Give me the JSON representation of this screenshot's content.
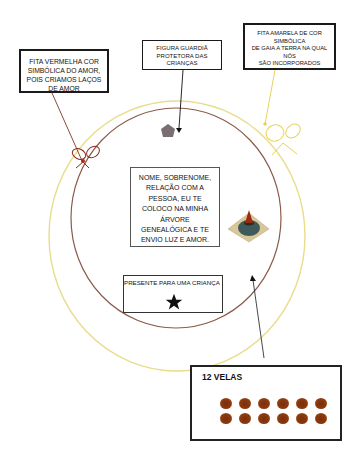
{
  "diagram": {
    "labels": {
      "red_ribbon": {
        "lines": [
          "FITA VERMELHA COR",
          "SIMBÓLICA DO AMOR,",
          "POIS CRIAMOS LAÇOS",
          "DE AMOR"
        ]
      },
      "guardian_figure": {
        "lines": [
          "FIGURA GUARDIÃ",
          "PROTETORA DAS",
          "CRIANÇAS"
        ]
      },
      "yellow_ribbon": {
        "lines": [
          "FITA AMARELA DE COR",
          "SIMBÓLICA",
          "DE GAIA A TERRA NA QUAL",
          "NÓS",
          "SÃO INCORPORADOS"
        ]
      },
      "center_text": {
        "lines": [
          "NOME, SOBRENOME,",
          "RELAÇÃO COM A",
          "PESSOA, EU TE",
          "COLOCO NA MINHA",
          "ÁRVORE",
          "GENEALÓGICA E TE",
          "ENVIO LUZ E AMOR."
        ]
      },
      "present": {
        "label": "PRESENTE PARA UMA CRIANÇA"
      },
      "candles": {
        "label": "12 VELAS",
        "count": 12,
        "rows": 2,
        "per_row": 6
      }
    },
    "colors": {
      "outer_circle": "#e9dc8a",
      "inner_circle": "#8a5a4a",
      "red_ribbon": "#8b2a1a",
      "yellow_ribbon": "#e6d45a",
      "candle": "#8b3a10",
      "guardian_pentagon": "#7a6e72",
      "star": "#111111"
    },
    "shapes": {
      "guardian": "pentagon",
      "present": "star",
      "central_candle": "candle-on-diamond",
      "bows": [
        "red-bow",
        "yellow-bow"
      ]
    }
  }
}
